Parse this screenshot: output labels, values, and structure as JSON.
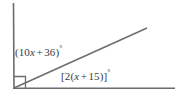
{
  "figure": {
    "kind": "geometry-diagram",
    "background_color": "#ffffff",
    "stroke_color": "#6b6b70",
    "text_color": "#3b3b40"
  },
  "labels": {
    "interior_angle": {
      "full_text": "(10x + 36)°",
      "open_paren": "(",
      "coefficient": "10",
      "variable": "x",
      "operator": "+",
      "constant": "36",
      "close_paren": ")",
      "degree": "°"
    },
    "base_angle": {
      "full_text": "[2(x + 15)]°",
      "open_bracket": "[",
      "coefficient": "2",
      "open_paren": "(",
      "variable": "x",
      "operator": "+",
      "constant": "15",
      "close_paren": ")",
      "close_bracket": "]",
      "degree": "°"
    }
  },
  "geometry": {
    "vertex": {
      "x": 14,
      "y": 88
    },
    "vertical_ray_end": {
      "x": 13,
      "y": 3
    },
    "horizontal_ray_end": {
      "x": 175,
      "y": 88
    },
    "diagonal_ray_end": {
      "x": 147,
      "y": 28
    },
    "right_angle_marker": {
      "x": 14,
      "y": 76,
      "size": 11
    }
  }
}
